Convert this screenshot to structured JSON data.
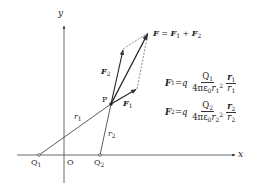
{
  "diagram": {
    "axes": {
      "x_label": "x",
      "y_label": "y",
      "origin_label": "O"
    },
    "charges": [
      {
        "label": "Q",
        "sub": "1"
      },
      {
        "label": "Q",
        "sub": "2"
      }
    ],
    "point": {
      "label": "P"
    },
    "distances": [
      {
        "label": "r",
        "sub": "1"
      },
      {
        "label": "r",
        "sub": "2"
      }
    ],
    "vectors": {
      "F1": {
        "label": "F",
        "sub": "1"
      },
      "F2": {
        "label": "F",
        "sub": "2"
      },
      "F_total": {
        "label": "F",
        "eq": " = ",
        "t1": "F",
        "t1sub": "1",
        "plus": " + ",
        "t2": "F",
        "t2sub": "2"
      }
    },
    "equations": [
      {
        "lhs": "F",
        "lhs_sub": "1",
        "eq": " = ",
        "q": "q",
        "num": "Q",
        "num_sub": "1",
        "den": "4πε",
        "den_sub0": "0",
        "den_r": "r",
        "den_rsub": "1",
        "den_exp": "2",
        "vec": "r",
        "vec_sub": "1",
        "vec_den": "r",
        "vec_den_sub": "1"
      },
      {
        "lhs": "F",
        "lhs_sub": "2",
        "eq": " = ",
        "q": "q",
        "num": "Q",
        "num_sub": "2",
        "den": "4πε",
        "den_sub0": "0",
        "den_r": "r",
        "den_rsub": "2",
        "den_exp": "2",
        "vec": "r",
        "vec_sub": "2",
        "vec_den": "r",
        "vec_den_sub": "2"
      }
    ],
    "colors": {
      "line": "#333333",
      "dashed": "#555555",
      "text": "#222222"
    }
  }
}
